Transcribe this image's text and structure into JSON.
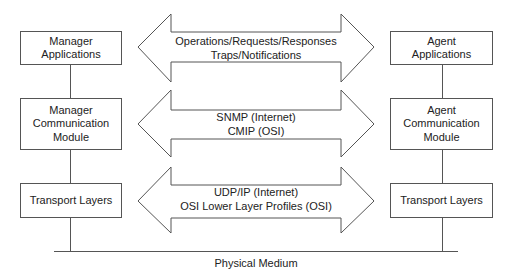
{
  "manager": {
    "applications": [
      "Manager",
      "Applications"
    ],
    "communication": [
      "Manager",
      "Communication",
      "Module"
    ],
    "transport": [
      "Transport Layers"
    ]
  },
  "agent": {
    "applications": [
      "Agent",
      "Applications"
    ],
    "communication": [
      "Agent",
      "Communication",
      "Module"
    ],
    "transport": [
      "Transport Layers"
    ]
  },
  "arrows": [
    {
      "lines": [
        "Operations/Requests/Responses",
        "Traps/Notifications"
      ]
    },
    {
      "lines": [
        "SNMP (Internet)",
        "CMIP (OSI)"
      ]
    },
    {
      "lines": [
        "UDP/IP (Internet)",
        "OSI Lower Layer Profiles (OSI)"
      ]
    }
  ],
  "medium": {
    "label": "Physical Medium"
  },
  "colors": {
    "stroke": "#555555",
    "text": "#222222",
    "background": "#ffffff"
  }
}
